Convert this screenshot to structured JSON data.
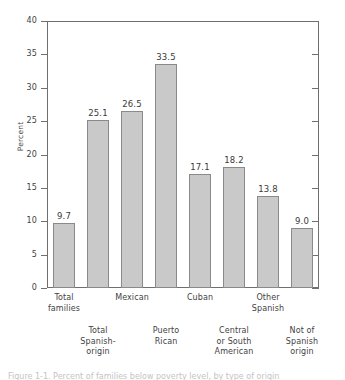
{
  "chart_data": {
    "type": "bar",
    "title": "",
    "xlabel": "",
    "ylabel": "Percent",
    "ylim": [
      0,
      40
    ],
    "ytick_values": [
      0,
      5,
      10,
      15,
      20,
      25,
      30,
      35,
      40
    ],
    "ytick_labels": [
      "0",
      "5",
      "10",
      "15",
      "20",
      "25",
      "30",
      "35",
      "40"
    ],
    "grid": false,
    "legend": "none",
    "categories": [
      "Total families",
      "Total Spanish-origin",
      "Mexican",
      "Puerto Rican",
      "Cuban",
      "Central or South American",
      "Other Spanish",
      "Not of Spanish origin"
    ],
    "category_label_lines": [
      [
        "Total",
        "families"
      ],
      [
        "Total",
        "Spanish-",
        "origin"
      ],
      [
        "Mexican"
      ],
      [
        "Puerto",
        "Rican"
      ],
      [
        "Cuban"
      ],
      [
        "Central",
        "or South",
        "American"
      ],
      [
        "Other",
        "Spanish"
      ],
      [
        "Not of",
        "Spanish",
        "origin"
      ]
    ],
    "values": [
      9.7,
      25.1,
      26.5,
      33.5,
      17.1,
      18.2,
      13.8,
      9.0
    ],
    "value_labels": [
      "9.7",
      "25.1",
      "26.5",
      "33.5",
      "17.1",
      "18.2",
      "13.8",
      "9.0"
    ],
    "bar_fill_color": "#c9c9c9",
    "bar_edge_color": "#8a8a8a",
    "axis_color": "#6f6f6f"
  },
  "caption": {
    "sliver_text": "Figure 1-1.  Percent of families below poverty level, by type of origin"
  }
}
